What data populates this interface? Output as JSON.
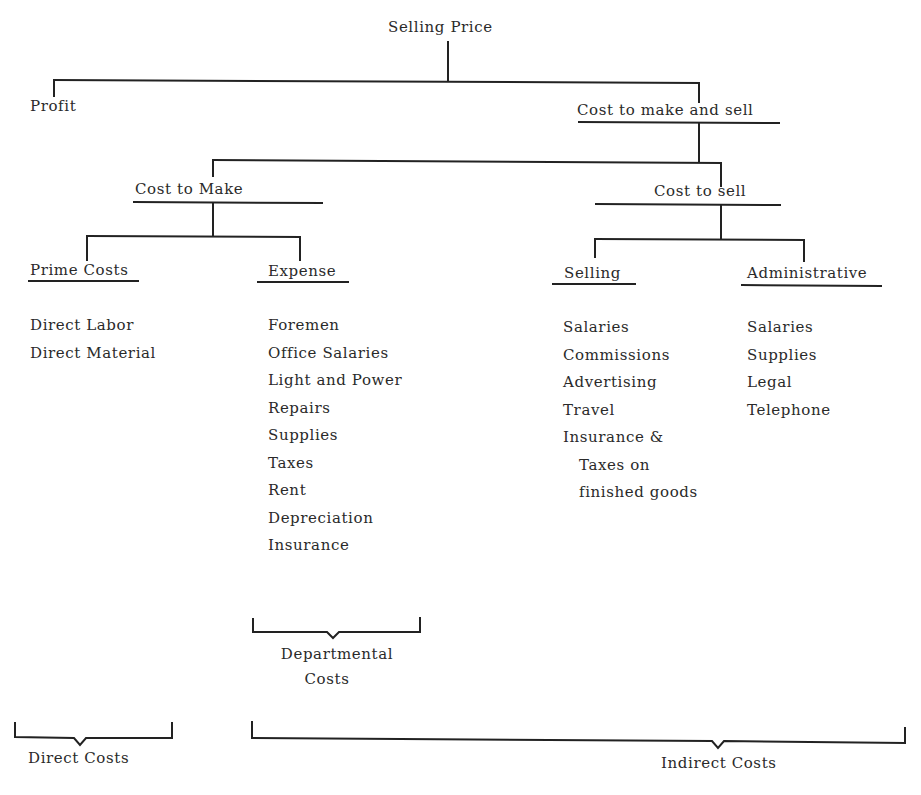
{
  "diagram": {
    "root": "Selling Price",
    "level1": {
      "profit": "Profit",
      "cost_to_make_and_sell": "Cost to make and sell"
    },
    "level2": {
      "cost_to_make": "Cost to Make",
      "cost_to_sell": "Cost to sell"
    },
    "level3": {
      "prime_costs": {
        "title": "Prime Costs",
        "items": [
          "Direct Labor",
          "Direct Material"
        ]
      },
      "expense": {
        "title": "Expense",
        "items": [
          "Foremen",
          "Office Salaries",
          "Light and Power",
          "Repairs",
          "Supplies",
          "Taxes",
          "Rent",
          "Depreciation",
          "Insurance"
        ]
      },
      "selling": {
        "title": "Selling",
        "items": [
          "Salaries",
          "Commissions",
          "Advertising",
          "Travel",
          "Insurance &",
          "Taxes on",
          "finished goods"
        ]
      },
      "administrative": {
        "title": "Administrative",
        "items": [
          "Salaries",
          "Supplies",
          "Legal",
          "Telephone"
        ]
      }
    },
    "groupings": {
      "departmental_costs_line1": "Departmental",
      "departmental_costs_line2": "Costs",
      "direct_costs": "Direct Costs",
      "indirect_costs": "Indirect Costs"
    }
  }
}
